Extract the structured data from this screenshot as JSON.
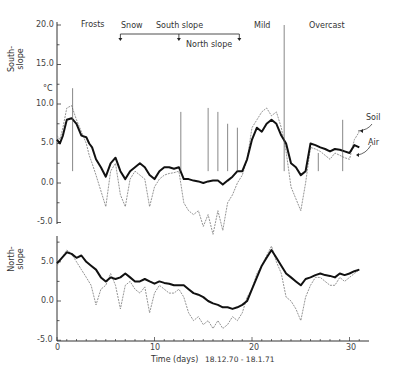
{
  "chart_data": {
    "type": "line",
    "title": "",
    "xlabel": "Time (days)",
    "date_range": "18.12.70 - 18.1.71",
    "x_ticks": [
      0,
      10,
      20,
      30
    ],
    "x_range": [
      0,
      31.5
    ],
    "unit": "°C",
    "annotations": {
      "periods": [
        "Frosts",
        "Snow",
        "Mild",
        "Overcast"
      ],
      "snow_south_slope": {
        "label": "South slope",
        "from_day": 6.5,
        "to_day": 12.5
      },
      "snow_north_slope": {
        "label": "North slope",
        "from_day": 12.5,
        "to_day": 18.5
      },
      "series_labels": [
        "Soil",
        "Air"
      ]
    },
    "panels": [
      {
        "name": "South-slope",
        "ylabel": "South-slope",
        "yticks": [
          20.0,
          15.0,
          10.0,
          5.0,
          0.0,
          -5.0
        ],
        "ylim": [
          -5.0,
          20.0
        ],
        "series": [
          {
            "name": "Soil",
            "x": [
              0,
              0.3,
              0.6,
              1,
              1.5,
              2,
              2.5,
              3,
              3.3,
              3.6,
              4,
              4.5,
              5,
              5.5,
              6,
              6.5,
              7,
              7.5,
              8,
              8.5,
              9,
              9.5,
              10,
              10.5,
              11,
              11.5,
              12,
              12.5,
              13,
              13.5,
              14,
              14.5,
              15,
              15.5,
              16,
              16.5,
              17,
              17.5,
              18,
              18.5,
              19,
              19.5,
              20,
              20.5,
              21,
              21.5,
              22,
              22.5,
              23,
              23.5,
              24,
              24.5,
              25,
              25.5,
              26,
              26.5,
              27,
              27.5,
              28,
              28.5,
              29,
              29.5,
              30,
              30.5,
              31
            ],
            "values": [
              5.5,
              5.0,
              6.0,
              8.0,
              8.2,
              7.5,
              6.0,
              5.8,
              5.0,
              4.5,
              3.0,
              2.0,
              0.8,
              2.5,
              3.2,
              1.5,
              0.5,
              1.5,
              2.0,
              2.5,
              2.0,
              1.0,
              0.5,
              1.5,
              2.0,
              2.0,
              1.8,
              2.0,
              0.5,
              0.5,
              0.3,
              0.2,
              0.0,
              0.2,
              0.3,
              0.3,
              -0.2,
              0.3,
              0.8,
              1.5,
              1.5,
              3.0,
              5.5,
              7.0,
              6.5,
              7.5,
              8.0,
              7.5,
              6.0,
              5.0,
              2.5,
              2.0,
              1.0,
              1.5,
              5.0,
              4.8,
              4.5,
              4.3,
              4.0,
              4.3,
              4.2,
              4.0,
              3.8,
              4.8,
              4.5
            ]
          },
          {
            "name": "Air",
            "x": [
              0,
              0.3,
              0.6,
              1,
              1.5,
              2,
              2.5,
              3,
              3.3,
              3.6,
              4,
              4.5,
              5,
              5.5,
              6,
              6.5,
              7,
              7.5,
              8,
              8.5,
              9,
              9.5,
              10,
              10.5,
              11,
              11.5,
              12,
              12.5,
              13,
              13.5,
              14,
              14.5,
              15,
              15.5,
              16,
              16.5,
              17,
              17.5,
              18,
              18.5,
              19,
              19.5,
              20,
              20.5,
              21,
              21.5,
              22,
              22.5,
              23,
              23.5,
              24,
              24.5,
              25,
              25.5,
              26,
              26.5,
              27,
              27.5,
              28,
              28.5,
              29,
              29.5,
              30,
              30.5,
              31
            ],
            "values": [
              6.0,
              5.5,
              7.0,
              9.5,
              9.8,
              8.0,
              6.5,
              5.0,
              3.5,
              2.5,
              1.0,
              -1.0,
              -3.0,
              1.5,
              2.5,
              -1.5,
              -3.0,
              0.5,
              1.5,
              1.0,
              0.5,
              -3.0,
              -0.5,
              0.5,
              1.0,
              1.2,
              1.3,
              1.5,
              -2.5,
              -3.5,
              -4.0,
              -3.5,
              -5.5,
              -4.0,
              -6.5,
              -3.5,
              -6.0,
              -2.5,
              -1.5,
              0.0,
              1.0,
              3.0,
              7.0,
              8.0,
              9.0,
              9.5,
              8.5,
              9.0,
              7.0,
              4.0,
              -0.5,
              -2.0,
              -3.5,
              0.0,
              4.5,
              4.3,
              4.0,
              3.5,
              3.0,
              3.8,
              3.5,
              3.2,
              3.0,
              5.5,
              6.5
            ]
          }
        ]
      },
      {
        "name": "North-slope",
        "ylabel": "North-slope",
        "yticks": [
          5.0,
          0.0,
          -5.0
        ],
        "ylim": [
          -5.0,
          8.0
        ],
        "series": [
          {
            "name": "Soil",
            "x": [
              0,
              0.5,
              1,
              1.5,
              2,
              2.5,
              3,
              3.5,
              4,
              4.5,
              5,
              5.5,
              6,
              6.5,
              7,
              7.5,
              8,
              8.5,
              9,
              9.5,
              10,
              10.5,
              11,
              11.5,
              12,
              12.5,
              13,
              13.5,
              14,
              14.5,
              15,
              15.5,
              16,
              16.5,
              17,
              17.5,
              18,
              18.5,
              19,
              19.5,
              20,
              20.5,
              21,
              21.5,
              22,
              22.5,
              23,
              23.5,
              24,
              24.5,
              25,
              25.5,
              26,
              26.5,
              27,
              27.5,
              28,
              28.5,
              29,
              29.5,
              30,
              30.5,
              31
            ],
            "values": [
              4.8,
              5.5,
              6.2,
              6.0,
              5.5,
              5.8,
              5.0,
              4.5,
              4.0,
              3.0,
              2.5,
              3.0,
              2.8,
              3.0,
              3.5,
              3.0,
              2.5,
              2.5,
              2.8,
              2.5,
              2.2,
              2.5,
              2.3,
              2.2,
              2.0,
              2.0,
              2.0,
              1.5,
              1.0,
              0.8,
              0.5,
              0.0,
              -0.3,
              -0.5,
              -0.8,
              -0.8,
              -1.0,
              -0.8,
              -0.5,
              0.0,
              1.5,
              3.0,
              4.5,
              5.5,
              6.5,
              5.5,
              4.5,
              3.5,
              3.0,
              2.5,
              2.0,
              2.8,
              3.0,
              3.3,
              3.5,
              3.3,
              3.2,
              3.0,
              3.5,
              3.3,
              3.5,
              3.8,
              4.0
            ]
          },
          {
            "name": "Air",
            "x": [
              0,
              0.5,
              1,
              1.5,
              2,
              2.5,
              3,
              3.5,
              4,
              4.5,
              5,
              5.5,
              6,
              6.5,
              7,
              7.5,
              8,
              8.5,
              9,
              9.5,
              10,
              10.5,
              11,
              11.5,
              12,
              12.5,
              13,
              13.5,
              14,
              14.5,
              15,
              15.5,
              16,
              16.5,
              17,
              17.5,
              18,
              18.5,
              19,
              19.5,
              20,
              20.5,
              21,
              21.5,
              22,
              22.5,
              23,
              23.5,
              24,
              24.5,
              25,
              25.5,
              26,
              26.5,
              27,
              27.5,
              28,
              28.5,
              29,
              29.5,
              30,
              30.5,
              31
            ],
            "values": [
              4.5,
              5.5,
              6.5,
              6.0,
              5.0,
              4.0,
              3.0,
              2.0,
              -0.5,
              1.5,
              2.0,
              3.5,
              2.0,
              -1.0,
              2.0,
              2.5,
              1.5,
              1.0,
              1.8,
              -1.5,
              1.0,
              2.0,
              1.5,
              1.0,
              1.0,
              1.5,
              0.5,
              -1.5,
              -2.5,
              -2.0,
              -3.0,
              -2.5,
              -3.5,
              -2.5,
              -3.5,
              -3.0,
              -2.0,
              -2.5,
              -1.5,
              0.5,
              1.5,
              3.5,
              4.5,
              5.8,
              7.0,
              5.0,
              3.5,
              0.5,
              0.0,
              -1.0,
              -2.5,
              0.5,
              2.0,
              3.0,
              3.0,
              2.5,
              2.0,
              2.0,
              3.0,
              2.5,
              3.0,
              3.5,
              4.0
            ]
          }
        ]
      }
    ]
  },
  "labels": {
    "south_slope": "South-\nslope",
    "south_slope_l1": "South-",
    "south_slope_l2": "slope",
    "north_slope_l1": "North-",
    "north_slope_l2": "slope",
    "unit": "°C",
    "frosts": "Frosts",
    "snow": "Snow",
    "south_slope_bracket": "South slope",
    "north_slope_bracket": "North slope",
    "mild": "Mild",
    "overcast": "Overcast",
    "soil": "Soil",
    "air": "Air",
    "xlabel": "Time (days)",
    "date_range": "18.12.70 - 18.1.71"
  },
  "ticks": {
    "upper": [
      "20.0",
      "15.0",
      "10.0",
      "5.0",
      "0.0",
      "-5.0"
    ],
    "lower": [
      "5.0",
      "0.0",
      "-5.0"
    ],
    "x": [
      "0",
      "10",
      "20",
      "30"
    ]
  }
}
